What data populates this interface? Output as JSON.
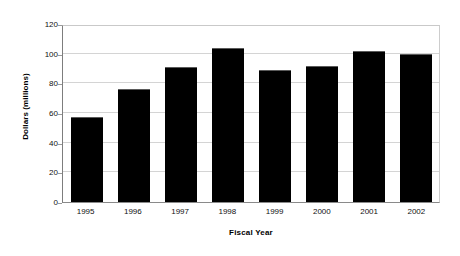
{
  "chart_data": {
    "type": "bar",
    "title": "",
    "subtitle": "",
    "xlabel": "Fiscal Year",
    "ylabel": "Dollars (millions)",
    "categories": [
      "1995",
      "1996",
      "1997",
      "1998",
      "1999",
      "2000",
      "2001",
      "2002"
    ],
    "values": [
      57,
      76,
      91,
      104,
      89,
      92,
      102,
      100
    ],
    "ylim": [
      0,
      120
    ],
    "ytick_labels": [
      "0",
      "20",
      "40",
      "60",
      "80",
      "100",
      "120"
    ],
    "ytick_values": [
      0,
      20,
      40,
      60,
      80,
      100,
      120
    ],
    "xlim_categories": 8,
    "grid": "horizontal",
    "legend": "none",
    "bar_color": "#000000",
    "gridline_color": "#d4d4d4",
    "axis_color": "#808080",
    "background_color": "#ffffff",
    "annotations": []
  }
}
